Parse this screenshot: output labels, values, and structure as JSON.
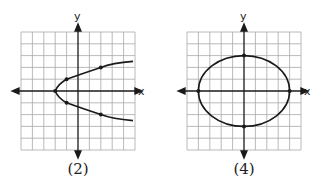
{
  "figures": [
    {
      "caption": "(2)",
      "x_label": "x",
      "y_label": "y",
      "curve": "parabola",
      "equation": "x = y^2 - 2",
      "points": [
        [
          -2,
          0
        ],
        [
          -1,
          1
        ],
        [
          -1,
          -1
        ],
        [
          2,
          2
        ],
        [
          2,
          -2
        ]
      ]
    },
    {
      "caption": "(4)",
      "x_label": "x",
      "y_label": "y",
      "curve": "ellipse",
      "equation": "x^2/16 + y^2/9 = 1",
      "points": [
        [
          -4,
          0
        ],
        [
          4,
          0
        ],
        [
          0,
          3
        ],
        [
          0,
          -3
        ]
      ]
    }
  ],
  "colors": {
    "grid": "#9a9a9a",
    "axis": "#1a1a1a",
    "curve": "#1a1a1a"
  }
}
